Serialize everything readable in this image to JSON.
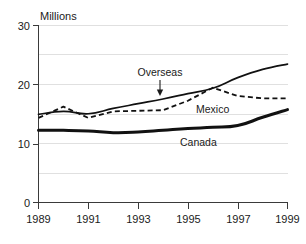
{
  "chart_data": {
    "type": "line",
    "title": "",
    "subtitle": "",
    "ylabel": "Millions",
    "xlabel": "",
    "xlim": [
      1989,
      1999
    ],
    "ylim": [
      0,
      30
    ],
    "yticks": [
      0,
      10,
      20,
      30
    ],
    "ytick_labels": [
      "0",
      "10",
      "20",
      "30"
    ],
    "gridlines_y": [
      5,
      10,
      15,
      20,
      25,
      30
    ],
    "grid": true,
    "xticks": [
      1989,
      1991,
      1993,
      1995,
      1997,
      1999
    ],
    "xtick_labels": [
      "1989",
      "1991",
      "1993",
      "1995",
      "1997",
      "1999"
    ],
    "legend_position": "inline-annotations",
    "x": [
      1989,
      1990,
      1991,
      1992,
      1993,
      1994,
      1995,
      1996,
      1997,
      1998,
      1999
    ],
    "series": [
      {
        "name": "Overseas",
        "style": "solid",
        "label": "Overseas",
        "values": [
          14.9,
          15.4,
          15.0,
          15.9,
          16.7,
          17.5,
          18.4,
          19.3,
          21.1,
          22.5,
          23.4
        ]
      },
      {
        "name": "Mexico",
        "style": "dashed",
        "label": "Mexico",
        "values": [
          14.3,
          16.2,
          14.3,
          15.4,
          15.5,
          15.6,
          17.2,
          19.4,
          18.0,
          17.6,
          17.6
        ]
      },
      {
        "name": "Canada",
        "style": "thick-solid",
        "label": "Canada",
        "values": [
          12.2,
          12.2,
          12.1,
          11.8,
          11.9,
          12.2,
          12.5,
          12.7,
          13.0,
          14.4,
          15.7
        ]
      }
    ],
    "annotations": [
      {
        "name": "overseas-pointer",
        "text": "Overseas",
        "target_x": 1994.0,
        "target_y": 17.5,
        "arrow": "down"
      },
      {
        "name": "mexico-label",
        "text": "Mexico",
        "at_x": 1995.6,
        "at_y": 16.1
      },
      {
        "name": "canada-label",
        "text": "Canada",
        "at_x": 1995.5,
        "at_y": 10.6
      }
    ],
    "colors": {
      "series_line": "#111111",
      "gridline": "#d8d8d8",
      "axis": "#3a3a3a",
      "background": "#ffffff",
      "text": "#1a1a1a"
    }
  }
}
